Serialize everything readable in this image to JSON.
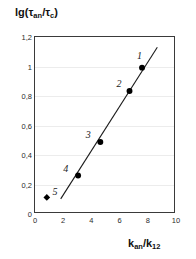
{
  "chart_data": {
    "type": "scatter",
    "title": "",
    "xlabel": "k_an/k_12",
    "ylabel": "lg(tau_an/tau_c)",
    "xlim": [
      0,
      10
    ],
    "ylim": [
      0,
      1.2
    ],
    "grid": true,
    "legend": null,
    "x_ticks": [
      "0",
      "2",
      "4",
      "6",
      "8",
      "10"
    ],
    "x_tick_values": [
      0,
      2,
      4,
      6,
      8,
      10
    ],
    "y_ticks": [
      "0",
      "0,2",
      "0,4",
      "0,6",
      "0,8",
      "1",
      "1,2"
    ],
    "y_tick_values": [
      0,
      0.2,
      0.4,
      0.6,
      0.8,
      1.0,
      1.2
    ],
    "decimal_separator": ",",
    "points": [
      {
        "label": "1",
        "x": 7.7,
        "y": 0.99,
        "marker": "circle",
        "label_dx": -4,
        "label_dy": -13
      },
      {
        "label": "2",
        "x": 6.8,
        "y": 0.83,
        "marker": "circle",
        "label_dx": -12,
        "label_dy": -9
      },
      {
        "label": "3",
        "x": 4.7,
        "y": 0.48,
        "marker": "circle",
        "label_dx": -13,
        "label_dy": -9
      },
      {
        "label": "4",
        "x": 3.1,
        "y": 0.25,
        "marker": "circle",
        "label_dx": -13,
        "label_dy": -9
      },
      {
        "label": "5",
        "x": 0.85,
        "y": 0.1,
        "marker": "diamond",
        "label_dx": 8,
        "label_dy": -8
      }
    ],
    "trend_line": {
      "x_start": 1.85,
      "y_start": 0.09,
      "x_end": 8.8,
      "y_end": 1.13
    },
    "colors": {
      "axis": "#3a3a3a",
      "grid": "#ececec",
      "marker": "#000000",
      "line": "#1a1a1a",
      "text": "#111111"
    }
  },
  "axis_captions": {
    "y_main": "lg(τ",
    "y_sub1": "an",
    "y_mid": "/τ",
    "y_sub2": "c",
    "y_end": ")",
    "x_main": "k",
    "x_sub1": "an",
    "x_mid": "/k",
    "x_sub2": "12"
  }
}
